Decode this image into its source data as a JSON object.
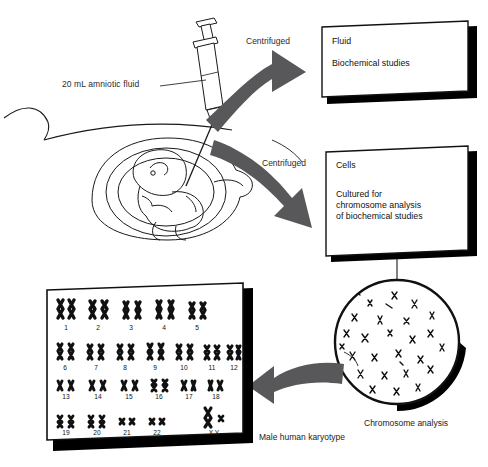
{
  "figure": {
    "colors": {
      "arrow_gray": "#58585a",
      "ink": "#111111",
      "shadow": "#000000",
      "paper": "#ffffff"
    }
  },
  "labels": {
    "amniotic_fluid": "20 mL amniotic fluid",
    "centrifuged_top": "Centrifuged",
    "centrifuged_bottom": "Centrifuged",
    "chromosome_analysis": "Chromosome analysis",
    "karyotype_caption": "Male human karyotype"
  },
  "boxes": [
    {
      "id": "fluid-box",
      "lines": [
        "Fluid",
        "Biochemical studies"
      ]
    },
    {
      "id": "cells-box",
      "lines": [
        "Cells",
        "Cultured for",
        "chromosome analysis",
        "of biochemical studies"
      ]
    }
  ],
  "karyotype": {
    "caption": "Male human karyotype",
    "rows": [
      {
        "labels": [
          "1",
          "2",
          "3",
          "4",
          "5"
        ]
      },
      {
        "labels": [
          "6",
          "7",
          "8",
          "9",
          "10",
          "11",
          "12"
        ]
      },
      {
        "labels": [
          "13",
          "14",
          "15",
          "16",
          "17",
          "18"
        ]
      },
      {
        "labels": [
          "19",
          "20",
          "21",
          "22",
          "X Y"
        ]
      }
    ]
  },
  "icons": {
    "syringe": "syringe-icon",
    "uterus": "uterus-fetus-icon",
    "metaphase": "metaphase-spread-icon",
    "arrow": "curved-arrow-icon"
  }
}
